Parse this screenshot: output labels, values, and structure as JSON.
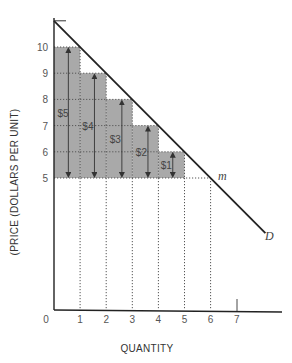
{
  "chart_data": {
    "type": "bar",
    "title": "",
    "xlabel": "QUANTITY",
    "ylabel": "(PRICE (DOLLARS PER UNIT)",
    "x_ticks": [
      "0",
      "1",
      "2",
      "3",
      "4",
      "5",
      "6",
      "7"
    ],
    "y_ticks": [
      "5",
      "6",
      "7",
      "8",
      "9",
      "10"
    ],
    "xlim": [
      0,
      8.3
    ],
    "ylim": [
      0,
      11.3
    ],
    "grid": false,
    "market_price": 5,
    "categories": [
      "1",
      "2",
      "3",
      "4",
      "5"
    ],
    "series": [
      {
        "name": "Price paid (bar top)",
        "values": [
          10,
          9,
          8,
          7,
          6
        ]
      },
      {
        "name": "Consumer surplus per unit",
        "values": [
          5,
          4,
          3,
          2,
          1
        ]
      }
    ],
    "bar_labels": [
      "$5",
      "$4",
      "$3",
      "$2",
      "$1"
    ],
    "demand_curve": {
      "label": "D",
      "points": [
        {
          "x": 0,
          "y": 11
        },
        {
          "x": 6,
          "y": 5
        },
        {
          "x": 8.1,
          "y": 2.9
        }
      ]
    },
    "annotations": [
      {
        "text": "m",
        "x": 6,
        "y": 5,
        "note": "point on demand curve at market price"
      },
      {
        "text": "D",
        "x": 8.1,
        "y": 2.9,
        "note": "demand curve label"
      }
    ]
  },
  "colors": {
    "bar_fill": "#a9a9a9",
    "line": "#222222",
    "dotted": "#666666",
    "text": "#555555"
  }
}
